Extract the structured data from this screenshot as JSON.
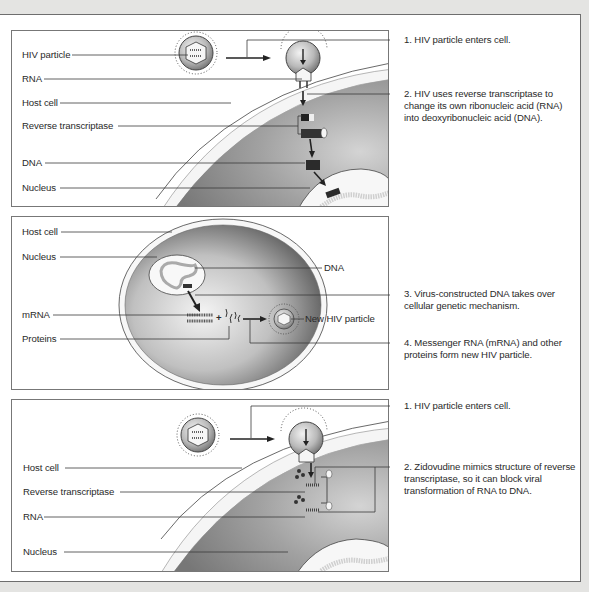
{
  "colors": {
    "background": "#e4e4e2",
    "frame_border": "#6e6e6e",
    "cytoplasm_dark": "#7a7a7a",
    "cytoplasm_light": "#c9c9c9",
    "membrane": "#f4f4f4",
    "leader_line": "#333333"
  },
  "panel1": {
    "labels": {
      "hiv_particle": "HIV particle",
      "rna": "RNA",
      "host_cell": "Host cell",
      "reverse_transcriptase": "Reverse transcriptase",
      "dna": "DNA",
      "nucleus": "Nucleus"
    },
    "steps": [
      {
        "text": "1. HIV particle enters cell."
      },
      {
        "text": "2. HIV uses reverse transcriptase to change its own ribonucleic acid (RNA) into deoxyribonucleic acid (DNA)."
      }
    ]
  },
  "panel2": {
    "labels": {
      "host_cell": "Host cell",
      "nucleus": "Nucleus",
      "dna": "DNA",
      "mrna": "mRNA",
      "proteins": "Proteins",
      "new_hiv_particle": "New HIV particle",
      "plus": "+"
    },
    "steps": [
      {
        "text": "3. Virus-constructed DNA takes over cellular genetic mechanism."
      },
      {
        "text": "4. Messenger RNA (mRNA) and other proteins form new HIV particle."
      }
    ]
  },
  "panel3": {
    "labels": {
      "host_cell": "Host cell",
      "reverse_transcriptase": "Reverse transcriptase",
      "rna": "RNA",
      "nucleus": "Nucleus"
    },
    "steps": [
      {
        "text": "1. HIV particle enters cell."
      },
      {
        "text": "2. Zidovudine mimics structure of reverse transcriptase, so it can block viral transformation of RNA to DNA."
      }
    ]
  }
}
